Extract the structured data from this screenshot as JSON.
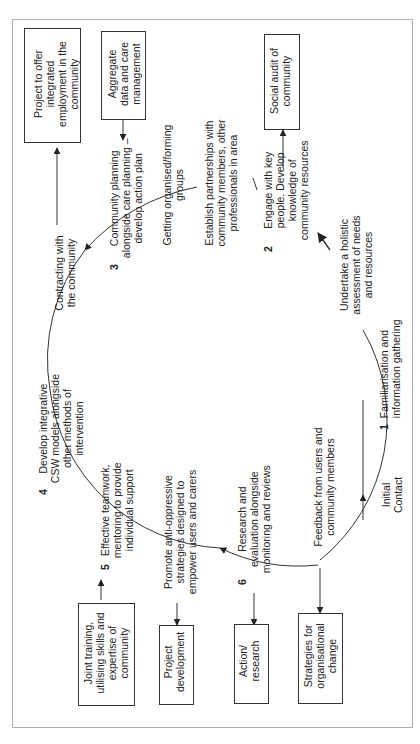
{
  "diagram": {
    "orientation": "rotated-90-ccw",
    "boxes": {
      "project_employment": "Project to offer\nintegrated\nemployment in the\ncommunity",
      "aggregate_data": "Aggregate\ndata and care\nmanagement",
      "social_audit": "Social audit of\ncommunity",
      "joint_training": "Joint training,\nutilising skills and\nexpertise of\ncommunity",
      "project_development": "Project\ndevelopment",
      "action_research": "Action/\nresearch",
      "strategies_change": "Strategies for\norganisational\nchange"
    },
    "stages": {
      "s1_num": "1",
      "s1": "Familiarisation and\ninformation gathering",
      "s2_num": "2",
      "s2": "Engage with key\npeople. Develop\nknowledge of\ncommunity resources",
      "s3_num": "3",
      "s3": "Community planning\nalongside care planning –\ndevelop action plan",
      "s4_num": "4",
      "s4": "Develop integrative\nCSW models alongside\nother methods of\nintervention",
      "s5_num": "5",
      "s5": "Effective teamwork,\nmentoring to provide\nindividual support",
      "s6_num": "6",
      "s6": "Research and\nevaluation alongside\nmonitoring and reviews"
    },
    "labels": {
      "initial_contact": "Initial\nContact",
      "holistic": "Undertake a holistic\nassessment of needs\nand resources",
      "partnerships": "Establish partnerships with\ncommunity members, other\nprofessionals in area",
      "getting_organised": "Getting organised/forming\ngroups",
      "contracting": "Contracting with\nthe community",
      "anti_oppressive": "Promote anti-oppressive\nstrategies designed to\nempower users and carers",
      "feedback": "Feedback from users and\ncommunity members",
      "slash": "/"
    }
  }
}
